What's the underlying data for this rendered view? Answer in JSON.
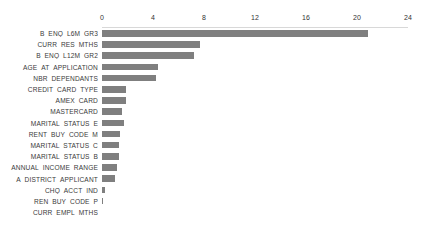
{
  "chart_data": {
    "type": "bar",
    "orientation": "horizontal",
    "title": "",
    "subtitle": "",
    "xlabel": "",
    "ylabel": "",
    "xlim": [
      0,
      24
    ],
    "xticks": [
      0,
      4,
      8,
      12,
      16,
      20,
      24
    ],
    "xtick_labels": [
      "0",
      "4",
      "8",
      "12",
      "16",
      "20",
      "24"
    ],
    "grid": false,
    "legend": null,
    "bar_color": "#7f7f7f",
    "axis_label_color": "#333333",
    "category_label_color": "#3a3a3a",
    "background_color": "#ffffff",
    "categories": [
      "B_ENQ_L6M_GR3",
      "CURR_RES_MTHS",
      "B_ENQ_L12M_GR2",
      "AGE_AT_APPLICATION",
      "NBR_DEPENDANTS",
      "CREDIT_CARD_TYPE",
      "AMEX_CARD",
      "MASTERCARD",
      "MARITAL_STATUS_E",
      "RENT_BUY_CODE_M",
      "MARITAL_STATUS_C",
      "MARITAL_STATUS_B",
      "ANNUAL_INCOME_RANGE",
      "A_DISTRICT_APPLICANT",
      "CHQ_ACCT_IND",
      "REN_BUY_CODE_P",
      "CURR_EMPL_MTHS"
    ],
    "values": [
      20.9,
      7.7,
      7.2,
      4.4,
      4.2,
      1.9,
      1.85,
      1.6,
      1.7,
      1.4,
      1.3,
      1.3,
      1.2,
      1.0,
      0.25,
      0.1,
      0.0
    ]
  }
}
